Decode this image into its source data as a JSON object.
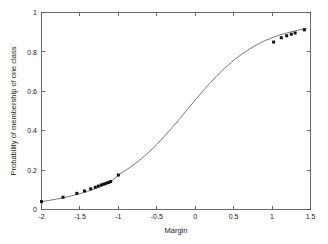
{
  "chart_data": {
    "type": "line",
    "title": "",
    "xlabel": "Margin",
    "ylabel": "Probability of membership of one class",
    "xlim": [
      -2,
      1.5
    ],
    "ylim": [
      0,
      1
    ],
    "xticks": [
      -2,
      -1.5,
      -1,
      -0.5,
      0,
      0.5,
      1,
      1.5
    ],
    "xticklabels": [
      "-2",
      "-1.5",
      "-1",
      "-0.5",
      "0",
      "0.5",
      "1",
      "1.5"
    ],
    "yticks": [
      0,
      0.2,
      0.4,
      0.6,
      0.8,
      1
    ],
    "yticklabels": [
      "0",
      "0.2",
      "0.4",
      "0.6",
      "0.8",
      "1"
    ],
    "grid": false,
    "legend": false,
    "series": [
      {
        "name": "sigmoid-fit",
        "style": "line",
        "color": "#4d4d4d",
        "x": [
          -2.0,
          -1.9,
          -1.8,
          -1.7,
          -1.6,
          -1.5,
          -1.4,
          -1.3,
          -1.2,
          -1.1,
          -1.0,
          -0.9,
          -0.8,
          -0.7,
          -0.6,
          -0.5,
          -0.4,
          -0.3,
          -0.2,
          -0.1,
          0.0,
          0.1,
          0.2,
          0.3,
          0.4,
          0.5,
          0.6,
          0.7,
          0.8,
          0.9,
          1.0,
          1.1,
          1.2,
          1.3,
          1.4,
          1.45
        ],
        "y": [
          0.04,
          0.046,
          0.053,
          0.061,
          0.07,
          0.08,
          0.092,
          0.106,
          0.122,
          0.14,
          0.175,
          0.2,
          0.227,
          0.258,
          0.292,
          0.33,
          0.372,
          0.416,
          0.462,
          0.509,
          0.556,
          0.601,
          0.645,
          0.686,
          0.723,
          0.757,
          0.787,
          0.813,
          0.836,
          0.856,
          0.872,
          0.886,
          0.897,
          0.907,
          0.916,
          0.92
        ]
      },
      {
        "name": "observed-points",
        "style": "markers",
        "color": "#111111",
        "x": [
          -2.0,
          -1.72,
          -1.54,
          -1.44,
          -1.36,
          -1.3,
          -1.26,
          -1.22,
          -1.19,
          -1.16,
          -1.13,
          -1.1,
          -1.0,
          1.02,
          1.12,
          1.19,
          1.25,
          1.3,
          1.42
        ],
        "y": [
          0.04,
          0.062,
          0.082,
          0.094,
          0.105,
          0.113,
          0.119,
          0.125,
          0.129,
          0.133,
          0.137,
          0.142,
          0.175,
          0.85,
          0.872,
          0.882,
          0.89,
          0.896,
          0.912
        ]
      }
    ]
  }
}
